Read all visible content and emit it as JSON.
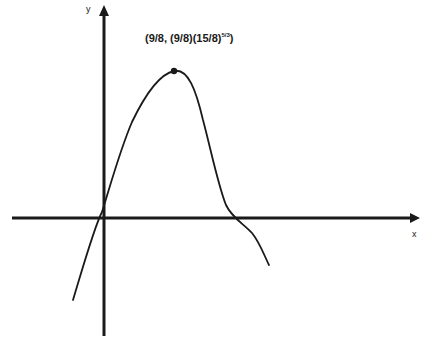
{
  "diagram": {
    "type": "function-graph",
    "axes": {
      "x_label": "x",
      "y_label": "y"
    },
    "max_point": {
      "label_prefix": "(9/8,  (9/8)(15/8)",
      "label_exponent": "5/3",
      "label_suffix": ")",
      "x": "9/8",
      "y": "(9/8)(15/8)^(5/3)"
    },
    "colors": {
      "stroke": "#1a1a1a",
      "background": "#ffffff"
    }
  }
}
